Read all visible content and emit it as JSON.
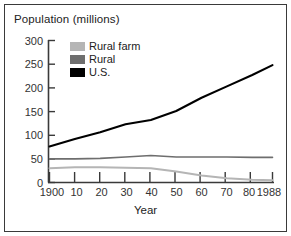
{
  "figure": {
    "title": "Population (millions)",
    "xlabel": "Year",
    "border_color": "#3a3a3a"
  },
  "legend": {
    "position": "inside-top-left",
    "items": [
      {
        "label": "Rural farm",
        "color": "#b5b5b5"
      },
      {
        "label": "Rural",
        "color": "#6e6e6e"
      },
      {
        "label": "U.S.",
        "color": "#000000"
      }
    ]
  },
  "axes": {
    "y_ticks": [
      "0",
      "50",
      "100",
      "150",
      "200",
      "250",
      "300"
    ],
    "x_ticks": [
      "1900",
      "10",
      "20",
      "30",
      "40",
      "50",
      "60",
      "70",
      "80",
      "1988"
    ]
  },
  "chart_data": {
    "type": "line",
    "title": "Population (millions)",
    "xlabel": "Year",
    "ylabel": "Population (millions)",
    "xlim": [
      1900,
      1988
    ],
    "ylim": [
      0,
      300
    ],
    "grid": false,
    "legend_position": "inside-top-left",
    "x": [
      1900,
      1910,
      1920,
      1930,
      1940,
      1950,
      1960,
      1970,
      1980,
      1988
    ],
    "x_tick_labels": [
      "1900",
      "10",
      "20",
      "30",
      "40",
      "50",
      "60",
      "70",
      "80",
      "1988"
    ],
    "y_ticks": [
      0,
      50,
      100,
      150,
      200,
      250,
      300
    ],
    "series": [
      {
        "name": "U.S.",
        "color": "#000000",
        "values": [
          76,
          92,
          106,
          123,
          132,
          151,
          179,
          203,
          227,
          248
        ]
      },
      {
        "name": "Rural",
        "color": "#6e6e6e",
        "values": [
          50,
          50,
          51,
          54,
          57,
          54,
          54,
          54,
          53,
          53
        ]
      },
      {
        "name": "Rural farm",
        "color": "#b5b5b5",
        "values": [
          30,
          32,
          32,
          31,
          30,
          23,
          15,
          9,
          6,
          5
        ]
      }
    ]
  }
}
